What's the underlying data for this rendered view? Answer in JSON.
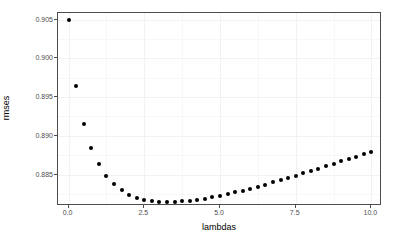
{
  "chart_data": {
    "type": "scatter",
    "title": "",
    "xlabel": "lambdas",
    "ylabel": "rmses",
    "xlim": [
      -0.35,
      10.35
    ],
    "ylim": [
      0.88095,
      0.90585
    ],
    "xticks": [
      0.0,
      2.5,
      5.0,
      7.5,
      10.0
    ],
    "xticklabels": [
      "0.0",
      "2.5",
      "5.0",
      "7.5",
      "10.0"
    ],
    "yticks": [
      0.885,
      0.89,
      0.895,
      0.9,
      0.905
    ],
    "yticklabels": [
      "0.885",
      "0.890",
      "0.895",
      "0.900",
      "0.905"
    ],
    "grid": true,
    "legend": null,
    "marker": "filled-circle",
    "marker_color": "#000000",
    "x": [
      0.0,
      0.25,
      0.5,
      0.75,
      1.0,
      1.25,
      1.5,
      1.75,
      2.0,
      2.25,
      2.5,
      2.75,
      3.0,
      3.25,
      3.5,
      3.75,
      4.0,
      4.25,
      4.5,
      4.75,
      5.0,
      5.25,
      5.5,
      5.75,
      6.0,
      6.25,
      6.5,
      6.75,
      7.0,
      7.25,
      7.5,
      7.75,
      8.0,
      8.25,
      8.5,
      8.75,
      9.0,
      9.25,
      9.5,
      9.75,
      10.0
    ],
    "y": [
      0.905,
      0.89648,
      0.89158,
      0.88843,
      0.88632,
      0.88484,
      0.88378,
      0.883,
      0.88243,
      0.88203,
      0.88176,
      0.88159,
      0.8815,
      0.88147,
      0.88149,
      0.88155,
      0.88164,
      0.88176,
      0.88191,
      0.88208,
      0.88227,
      0.88248,
      0.8827,
      0.88294,
      0.88319,
      0.88345,
      0.88372,
      0.884,
      0.88428,
      0.88457,
      0.88487,
      0.88517,
      0.88547,
      0.88578,
      0.88609,
      0.8864,
      0.88671,
      0.88702,
      0.88733,
      0.88764,
      0.88795
    ]
  },
  "axes": {
    "x_title": "lambdas",
    "y_title": "rmses"
  }
}
